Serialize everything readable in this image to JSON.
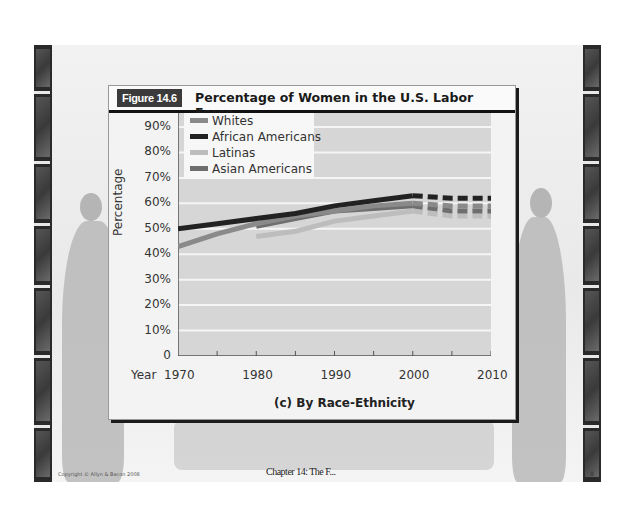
{
  "slide": {
    "figure_label": "Figure 14.6",
    "figure_title": "Percentage of Women in the U.S. Labor Force",
    "subtitle": "(c) By Race-Ethnicity",
    "footer_left": "Copyright © Allyn & Bacon 2008",
    "footer_center": "Chapter 14: The F...",
    "footer_right": "8"
  },
  "colors": {
    "whites": "#8a8a8a",
    "african_americans": "#222222",
    "latinas": "#bdbdbd",
    "asian_americans": "#6e6e6e",
    "plot_bg": "#d6d6d6",
    "gridline": "#f5f5f5"
  },
  "chart_data": {
    "type": "line",
    "title": "Percentage of Women in the U.S. Labor Force",
    "subtitle": "(c) By Race-Ethnicity",
    "xlabel": "Year",
    "ylabel": "Percentage",
    "x_ticks": [
      "1970",
      "1980",
      "1990",
      "2000",
      "2010"
    ],
    "y_ticks": [
      "0",
      "10%",
      "20%",
      "30%",
      "40%",
      "50%",
      "60%",
      "70%",
      "80%",
      "90%"
    ],
    "ylim": [
      0,
      90
    ],
    "xlim": [
      1970,
      2010
    ],
    "grid": true,
    "legend_position": "upper-left",
    "projection_note": "Values after 2000 drawn dashed (projected)",
    "x": [
      1970,
      1975,
      1980,
      1985,
      1990,
      1995,
      2000,
      2005,
      2010
    ],
    "series": [
      {
        "name": "Whites",
        "values": [
          43,
          48,
          52,
          55,
          57,
          59,
          60,
          59,
          59
        ]
      },
      {
        "name": "African Americans",
        "values": [
          50,
          52,
          54,
          56,
          59,
          61,
          63,
          62,
          62
        ]
      },
      {
        "name": "Latinas",
        "values": [
          null,
          null,
          47,
          49,
          53,
          55,
          57,
          55,
          55
        ]
      },
      {
        "name": "Asian Americans",
        "values": [
          null,
          null,
          51,
          54,
          57,
          58,
          59,
          57,
          57
        ]
      }
    ]
  }
}
